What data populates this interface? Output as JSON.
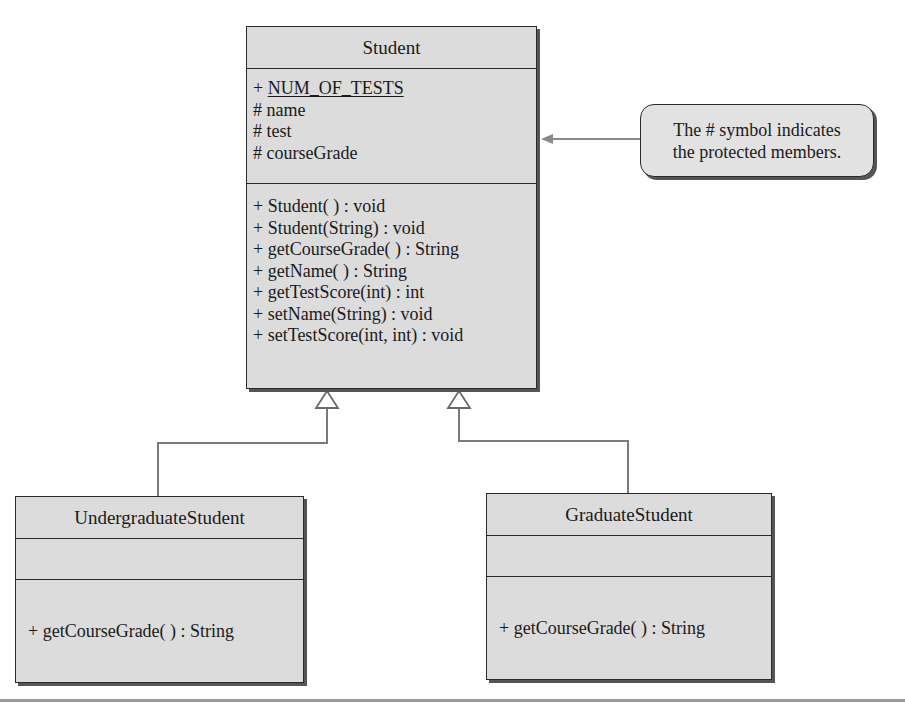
{
  "diagram": {
    "type": "uml-class-diagram",
    "classes": {
      "student": {
        "name": "Student",
        "attributes": [
          {
            "visibility": "+",
            "name": "NUM_OF_TESTS",
            "static": true,
            "text": "+ NUM_OF_TESTS"
          },
          {
            "visibility": "#",
            "name": "name",
            "text": "# name"
          },
          {
            "visibility": "#",
            "name": "test",
            "text": "# test"
          },
          {
            "visibility": "#",
            "name": "courseGrade",
            "text": "# courseGrade"
          }
        ],
        "attr_prefix_0": "+ ",
        "attr_static_name_0": "NUM_OF_TESTS",
        "operations": [
          {
            "text": "+ Student( ) : void"
          },
          {
            "text": "+ Student(String) : void"
          },
          {
            "text": "+ getCourseGrade( ) : String"
          },
          {
            "text": "+ getName( ) : String"
          },
          {
            "text": "+ getTestScore(int) : int"
          },
          {
            "text": "+ setName(String) : void"
          },
          {
            "text": "+ setTestScore(int, int) : void"
          }
        ]
      },
      "undergraduate": {
        "name": "UndergraduateStudent",
        "attributes": [],
        "operations": [
          {
            "text": "+ getCourseGrade( ) : String"
          }
        ]
      },
      "graduate": {
        "name": "GraduateStudent",
        "attributes": [],
        "operations": [
          {
            "text": "+ getCourseGrade( ) : String"
          }
        ]
      }
    },
    "relationships": [
      {
        "type": "generalization",
        "from": "UndergraduateStudent",
        "to": "Student"
      },
      {
        "type": "generalization",
        "from": "GraduateStudent",
        "to": "Student"
      }
    ],
    "callout": {
      "line1": "The # symbol indicates",
      "line2": "the protected members.",
      "points_to": "Student attributes"
    },
    "colors": {
      "box_fill": "#dcdcdc",
      "box_border": "#2a2a2a",
      "connector": "#7a7a7a",
      "rule": "#9a9a9a"
    }
  }
}
